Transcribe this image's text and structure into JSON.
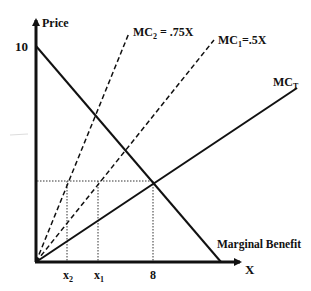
{
  "diagram": {
    "type": "economics-marginal-cost-benefit",
    "y_axis": {
      "label": "Price",
      "tick_label": "10"
    },
    "x_axis": {
      "label": "X",
      "tick_labels": [
        "x",
        "x",
        "8"
      ],
      "tick_subscripts": [
        "2",
        "1",
        ""
      ]
    },
    "curves": {
      "mc2": {
        "label": "MC",
        "subscript": "2",
        "equation": " = .75X",
        "style": "dashed"
      },
      "mc1": {
        "label": "MC",
        "subscript": "1",
        "equation": "=.5X",
        "style": "dashed"
      },
      "mct": {
        "label": "MC",
        "subscript": "T",
        "style": "solid"
      },
      "mb": {
        "label": "Marginal Benefit",
        "style": "solid"
      }
    },
    "equilibrium": {
      "x": "8",
      "guide_style": "dotted"
    }
  }
}
